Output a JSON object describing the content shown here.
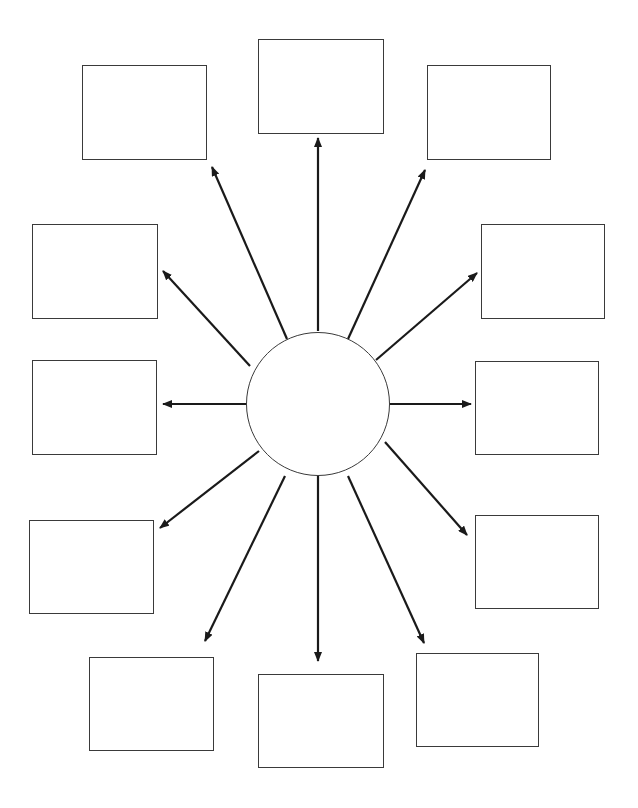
{
  "diagram": {
    "type": "radial-web-organizer",
    "stroke_color": "#1a1a1a",
    "box_border_color": "#3a3a3a",
    "hub": {
      "cx": 318,
      "cy": 404,
      "r": 72,
      "label": ""
    },
    "boxes": [
      {
        "id": "top-left",
        "x": 82,
        "y": 65,
        "w": 125,
        "h": 95,
        "label": ""
      },
      {
        "id": "top",
        "x": 258,
        "y": 39,
        "w": 126,
        "h": 95,
        "label": ""
      },
      {
        "id": "top-right",
        "x": 427,
        "y": 65,
        "w": 124,
        "h": 95,
        "label": ""
      },
      {
        "id": "upper-left",
        "x": 32,
        "y": 224,
        "w": 126,
        "h": 95,
        "label": ""
      },
      {
        "id": "upper-right",
        "x": 481,
        "y": 224,
        "w": 124,
        "h": 95,
        "label": ""
      },
      {
        "id": "mid-left",
        "x": 32,
        "y": 360,
        "w": 125,
        "h": 95,
        "label": ""
      },
      {
        "id": "mid-right",
        "x": 475,
        "y": 361,
        "w": 124,
        "h": 94,
        "label": ""
      },
      {
        "id": "lower-left",
        "x": 29,
        "y": 520,
        "w": 125,
        "h": 94,
        "label": ""
      },
      {
        "id": "lower-right",
        "x": 475,
        "y": 515,
        "w": 124,
        "h": 94,
        "label": ""
      },
      {
        "id": "bottom-left",
        "x": 89,
        "y": 657,
        "w": 125,
        "h": 94,
        "label": ""
      },
      {
        "id": "bottom",
        "x": 258,
        "y": 674,
        "w": 126,
        "h": 94,
        "label": ""
      },
      {
        "id": "bottom-right",
        "x": 416,
        "y": 653,
        "w": 123,
        "h": 94,
        "label": ""
      }
    ],
    "arrows": [
      {
        "to": "top-left",
        "x1": 287,
        "y1": 339,
        "x2": 212,
        "y2": 167
      },
      {
        "to": "top",
        "x1": 318,
        "y1": 331,
        "x2": 318,
        "y2": 138
      },
      {
        "to": "top-right",
        "x1": 348,
        "y1": 339,
        "x2": 425,
        "y2": 170
      },
      {
        "to": "upper-left",
        "x1": 250,
        "y1": 366,
        "x2": 163,
        "y2": 271
      },
      {
        "to": "upper-right",
        "x1": 376,
        "y1": 360,
        "x2": 477,
        "y2": 273
      },
      {
        "to": "mid-left",
        "x1": 246,
        "y1": 404,
        "x2": 163,
        "y2": 404
      },
      {
        "to": "mid-right",
        "x1": 390,
        "y1": 404,
        "x2": 471,
        "y2": 404
      },
      {
        "to": "lower-left",
        "x1": 259,
        "y1": 451,
        "x2": 160,
        "y2": 528
      },
      {
        "to": "lower-right",
        "x1": 385,
        "y1": 442,
        "x2": 467,
        "y2": 535
      },
      {
        "to": "bottom-left",
        "x1": 285,
        "y1": 476,
        "x2": 205,
        "y2": 641
      },
      {
        "to": "bottom",
        "x1": 318,
        "y1": 476,
        "x2": 318,
        "y2": 661
      },
      {
        "to": "bottom-right",
        "x1": 348,
        "y1": 476,
        "x2": 424,
        "y2": 643
      }
    ]
  }
}
